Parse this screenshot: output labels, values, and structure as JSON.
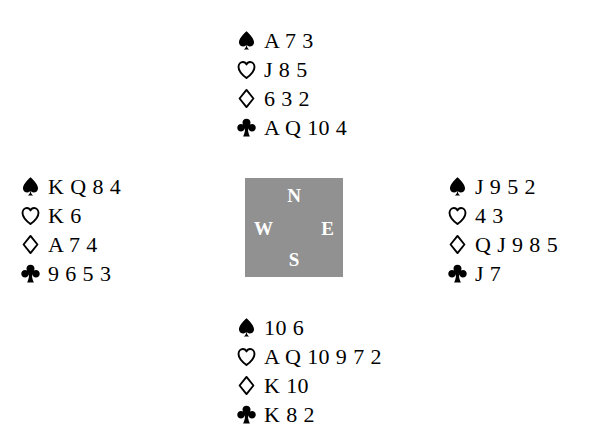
{
  "diagram": {
    "type": "bridge-deal",
    "colors": {
      "pip": "#000000",
      "compass_box": "#919191",
      "compass_label": "#ffffff",
      "background": "#ffffff"
    },
    "suits": {
      "spade": {
        "name": "spade",
        "symbol": "♠",
        "style": "filled"
      },
      "heart": {
        "name": "heart",
        "symbol": "♡",
        "style": "outline"
      },
      "diamond": {
        "name": "diamond",
        "symbol": "♢",
        "style": "outline"
      },
      "club": {
        "name": "club",
        "symbol": "♣",
        "style": "filled"
      }
    },
    "compass": {
      "north": "N",
      "west": "W",
      "east": "E",
      "south": "S"
    },
    "hands": {
      "north": {
        "position": "North",
        "spades": "A 7 3",
        "hearts": "J 8 5",
        "diamonds": "6 3 2",
        "clubs": "A Q 10 4"
      },
      "west": {
        "position": "West",
        "spades": "K Q 8 4",
        "hearts": "K 6",
        "diamonds": "A 7 4",
        "clubs": "9 6 5 3"
      },
      "east": {
        "position": "East",
        "spades": "J 9 5 2",
        "hearts": "4 3",
        "diamonds": "Q J 9 8 5",
        "clubs": "J 7"
      },
      "south": {
        "position": "South",
        "spades": "10 6",
        "hearts": "A Q 10 9 7 2",
        "diamonds": "K 10",
        "clubs": "K 8 2"
      }
    }
  }
}
